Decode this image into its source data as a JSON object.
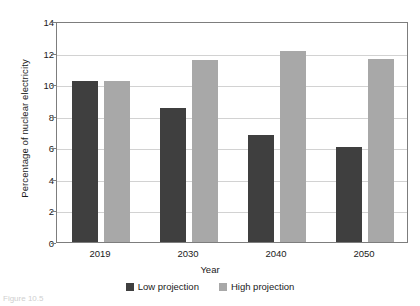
{
  "chart_data": {
    "type": "bar",
    "title": "",
    "xlabel": "Year",
    "ylabel": "Percentage of nuclear electricity",
    "categories": [
      "2019",
      "2030",
      "2040",
      "2050"
    ],
    "series": [
      {
        "name": "Low projection",
        "color": "#3f3f3f",
        "values": [
          10.2,
          8.5,
          6.8,
          6.0
        ]
      },
      {
        "name": "High projection",
        "color": "#a8a8a8",
        "values": [
          10.2,
          11.5,
          12.1,
          11.6
        ]
      }
    ],
    "ylim": [
      0,
      14
    ],
    "yticks": [
      0,
      2,
      4,
      6,
      8,
      10,
      12,
      14
    ],
    "ytick_labels": [
      "0",
      "2",
      "4",
      "6",
      "8",
      "10",
      "12",
      "14"
    ],
    "grid": true,
    "legend_position": "bottom"
  },
  "caption": {
    "text": "Figure 10.5"
  }
}
